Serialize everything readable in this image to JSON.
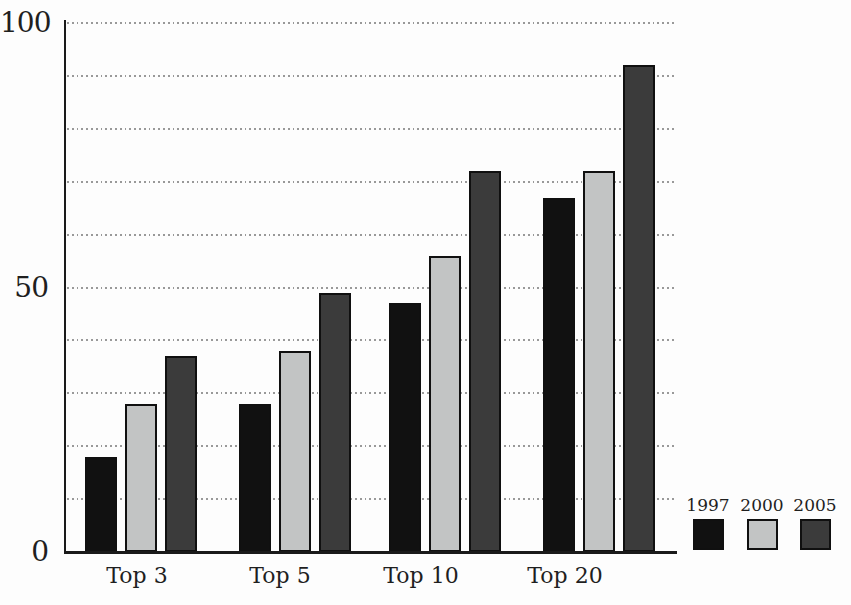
{
  "chart_data": {
    "type": "bar",
    "title": "",
    "xlabel": "",
    "ylabel": "",
    "categories": [
      "Top 3",
      "Top 5",
      "Top 10",
      "Top 20"
    ],
    "series": [
      {
        "name": "1997",
        "color": "#111111",
        "values": [
          18,
          28,
          47,
          67
        ]
      },
      {
        "name": "2000",
        "color": "#c2c4c4",
        "values": [
          28,
          38,
          56,
          72
        ]
      },
      {
        "name": "2005",
        "color": "#3b3b3b",
        "values": [
          37,
          49,
          72,
          92
        ]
      }
    ],
    "ylim": [
      0,
      100
    ],
    "yticks": [
      0,
      50,
      100
    ],
    "gridline_step": 10,
    "grid": "dotted horizontal gridlines every 10 units",
    "legend_position": "bottom-right",
    "legend_labels": [
      "1997",
      "2000",
      "2005"
    ]
  },
  "colors": {
    "background": "#fdfdfd",
    "axis": "#1a1a1a",
    "grid_dots": "#999999",
    "text": "#1f1f1f",
    "bar_outline": "#101010"
  }
}
